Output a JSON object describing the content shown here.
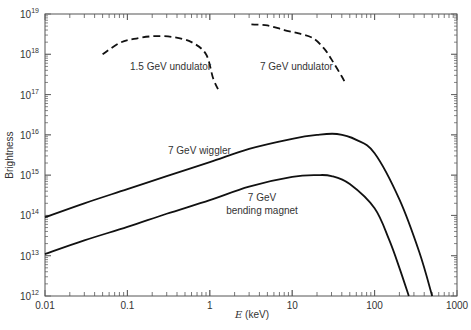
{
  "chart_data": {
    "type": "line",
    "title": "",
    "xlabel": "E (keV)",
    "xlabel_italic_part": "E",
    "xlabel_unit": "(keV)",
    "ylabel": "Brightness",
    "xscale": "log",
    "yscale": "log",
    "xlim": [
      0.01,
      1000
    ],
    "ylim": [
      1000000000000.0,
      1e+19
    ],
    "x_ticks": [
      "0.01",
      "0.1",
      "1",
      "10",
      "100",
      "1000"
    ],
    "y_ticks": [
      "10^12",
      "10^13",
      "10^14",
      "10^15",
      "10^16",
      "10^17",
      "10^18",
      "10^19"
    ],
    "grid": false,
    "legend": "inline annotations",
    "series": [
      {
        "name": "1.5 GeV undulator",
        "style": "dashed",
        "x": [
          0.05,
          0.08,
          0.12,
          0.2,
          0.35,
          0.6,
          0.9,
          1.1,
          1.3
        ],
        "y": [
          1e+18,
          1.9e+18,
          2.4e+18,
          2.8e+18,
          2.7e+18,
          2e+18,
          1e+18,
          2.5e+17,
          1.2e+17
        ]
      },
      {
        "name": "7 GeV undulator",
        "style": "dashed",
        "x": [
          3.2,
          5,
          8,
          12,
          18,
          25,
          32,
          40,
          45
        ],
        "y": [
          5.5e+18,
          5.2e+18,
          4e+18,
          3.3e+18,
          2.5e+18,
          1.3e+18,
          6e+17,
          2.8e+17,
          1.8e+17
        ]
      },
      {
        "name": "7 GeV wiggler",
        "style": "solid",
        "x": [
          0.01,
          0.03,
          0.1,
          0.3,
          1,
          3,
          10,
          20,
          35,
          60,
          100,
          200,
          350,
          500
        ],
        "y": [
          90000000000000.0,
          200000000000000.0,
          450000000000000.0,
          950000000000000.0,
          2100000000000000.0,
          4500000000000000.0,
          8000000000000000.0,
          1e+16,
          1.05e+16,
          7500000000000000.0,
          3500000000000000.0,
          250000000000000.0,
          12000000000000.0,
          1000000000000.0
        ]
      },
      {
        "name": "7 GeV bending magnet",
        "style": "solid",
        "x": [
          0.01,
          0.03,
          0.1,
          0.3,
          1,
          3,
          10,
          20,
          30,
          50,
          100,
          150,
          200,
          260
        ],
        "y": [
          11000000000000.0,
          24000000000000.0,
          52000000000000.0,
          110000000000000.0,
          240000000000000.0,
          520000000000000.0,
          900000000000000.0,
          1000000000000000.0,
          950000000000000.0,
          600000000000000.0,
          150000000000000.0,
          25000000000000.0,
          5000000000000.0,
          1000000000000.0
        ]
      }
    ],
    "annotations": [
      {
        "text": "1.5 GeV undulator",
        "x": 0.25,
        "y": 4.5e+17
      },
      {
        "text": "7 GeV undulator",
        "x": 9,
        "y": 4.5e+17
      },
      {
        "text": "7 GeV wiggler",
        "x": 0.45,
        "y": 3000000000000000.0
      },
      {
        "text": "7 GeV",
        "x": 6,
        "y": 220000000000000.0
      },
      {
        "text": "bending magnet",
        "x": 6,
        "y": 110000000000000.0
      }
    ]
  },
  "labels": {
    "ylabel": "Brightness",
    "xlabel_var": "E",
    "xlabel_unit": " (keV)",
    "x_ticks": [
      "0.01",
      "0.1",
      "1",
      "10",
      "100",
      "1000"
    ],
    "y_base": "10",
    "y_exps": [
      "12",
      "13",
      "14",
      "15",
      "16",
      "17",
      "18",
      "19"
    ],
    "ann_und15": "1.5 GeV undulator",
    "ann_und7": "7 GeV undulator",
    "ann_wig": "7 GeV wiggler",
    "ann_bm1": "7 GeV",
    "ann_bm2": "bending magnet"
  }
}
